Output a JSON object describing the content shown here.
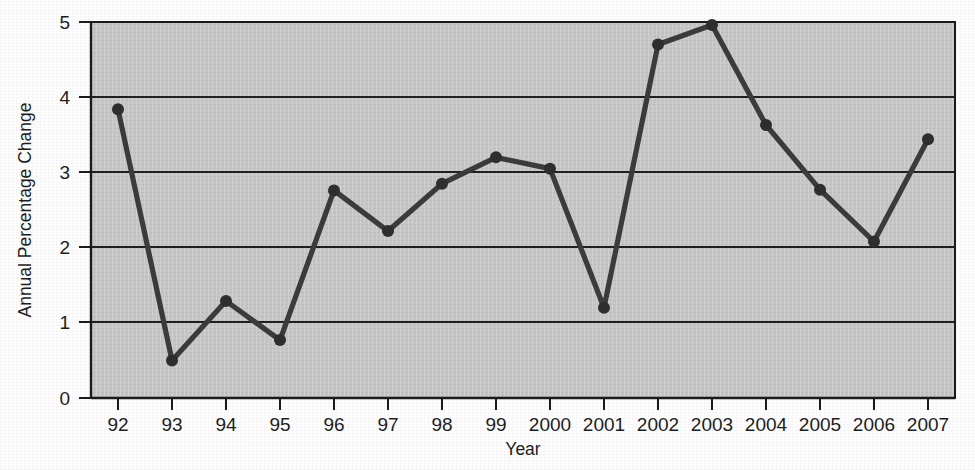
{
  "chart_data": {
    "type": "line",
    "title": "",
    "xlabel": "Year",
    "ylabel": "Annual Percentage Change",
    "categories": [
      "92",
      "93",
      "94",
      "95",
      "96",
      "97",
      "98",
      "99",
      "2000",
      "2001",
      "2002",
      "2003",
      "2004",
      "2005",
      "2006",
      "2007"
    ],
    "values": [
      3.84,
      0.5,
      1.29,
      0.77,
      2.76,
      2.22,
      2.85,
      3.2,
      3.05,
      1.2,
      4.7,
      4.96,
      3.63,
      2.77,
      2.08,
      3.44
    ],
    "series": [
      {
        "name": "Annual Percentage Change",
        "values": [
          3.84,
          0.5,
          1.29,
          0.77,
          2.76,
          2.22,
          2.85,
          3.2,
          3.05,
          1.2,
          4.7,
          4.96,
          3.63,
          2.77,
          2.08,
          3.44
        ]
      }
    ],
    "xlim": [
      -0.2,
      15.2
    ],
    "ylim": [
      0,
      5
    ],
    "ytick_labels": [
      "0",
      "1",
      "2",
      "3",
      "4",
      "5"
    ],
    "ytick_values": [
      0,
      1,
      2,
      3,
      4,
      5
    ],
    "grid": "horizontal",
    "legend": "none",
    "marker": "circle",
    "colors": {
      "line": "#3b3b3b",
      "marker": "#2e2e2e",
      "plot_background": "#c6c6c6",
      "grid": "#1f1f1f",
      "axis": "#1a1a1a",
      "text": "#1d1d1d",
      "page_background": "#fdfdfd"
    }
  },
  "axes": {
    "x_title": "Year",
    "y_title": "Annual Percentage Change"
  }
}
